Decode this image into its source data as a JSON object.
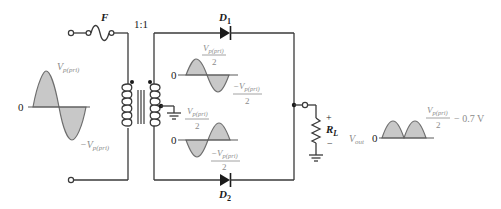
{
  "diagram": {
    "components": {
      "fuse": {
        "label": "F"
      },
      "transformer": {
        "ratio": "1:1"
      },
      "diode1": {
        "label": "D",
        "subscript": "1"
      },
      "diode2": {
        "label": "D",
        "subscript": "2"
      },
      "load": {
        "label": "R",
        "subscript": "L",
        "plus": "+",
        "minus": "−"
      }
    },
    "input_wave": {
      "zero": "0",
      "peak_pos": "V",
      "peak_pos_sub": "p(pri)",
      "peak_neg": "−V",
      "peak_neg_sub": "p(pri)"
    },
    "upper_secondary_wave": {
      "zero": "0",
      "peak_pos_num": "V",
      "peak_pos_sub": "p(pri)",
      "peak_pos_den": "2",
      "peak_neg_num": "−V",
      "peak_neg_sub": "p(pri)",
      "peak_neg_den": "2"
    },
    "lower_secondary_wave": {
      "zero": "0",
      "peak_pos_num": "V",
      "peak_pos_sub": "p(pri)",
      "peak_pos_den": "2",
      "peak_neg_num": "−V",
      "peak_neg_sub": "p(pri)",
      "peak_neg_den": "2"
    },
    "output_wave": {
      "label": "V",
      "label_sub": "out",
      "zero": "0",
      "peak_num": "V",
      "peak_sub": "p(pri)",
      "peak_den": "2",
      "peak_suffix": "− 0.7 V"
    }
  }
}
